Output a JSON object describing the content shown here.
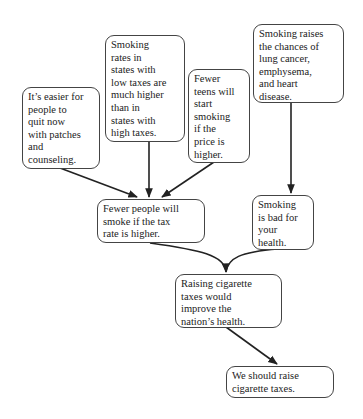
{
  "diagram": {
    "type": "argument-map",
    "nodes": [
      {
        "id": "A",
        "lines": [
          "It’s easier for",
          "people to",
          "quit now",
          "with patches",
          "and",
          "counseling."
        ]
      },
      {
        "id": "B",
        "lines": [
          "Smoking",
          "rates in",
          "states with",
          "low taxes are",
          "much higher",
          "than in",
          "states with",
          "high taxes."
        ]
      },
      {
        "id": "C",
        "lines": [
          "Fewer",
          "teens will",
          "start",
          "smoking",
          "if the",
          "price is",
          "higher."
        ]
      },
      {
        "id": "D",
        "lines": [
          "Smoking raises",
          "the chances of",
          "lung cancer,",
          "emphysema,",
          "and heart",
          "disease."
        ]
      },
      {
        "id": "E",
        "lines": [
          "Fewer people will",
          "smoke if the tax",
          "rate is higher."
        ]
      },
      {
        "id": "F",
        "lines": [
          "Smoking",
          "is bad for",
          "your",
          "health."
        ]
      },
      {
        "id": "G",
        "lines": [
          "Raising cigarette",
          "taxes would",
          "improve the",
          "nation’s health."
        ]
      },
      {
        "id": "H",
        "lines": [
          "We should raise",
          "cigarette taxes."
        ]
      }
    ],
    "edges": [
      {
        "from": "A",
        "to": "E"
      },
      {
        "from": "B",
        "to": "E"
      },
      {
        "from": "C",
        "to": "E"
      },
      {
        "from": "D",
        "to": "F"
      },
      {
        "from": "E",
        "to": "G"
      },
      {
        "from": "F",
        "to": "G"
      },
      {
        "from": "G",
        "to": "H"
      }
    ]
  }
}
